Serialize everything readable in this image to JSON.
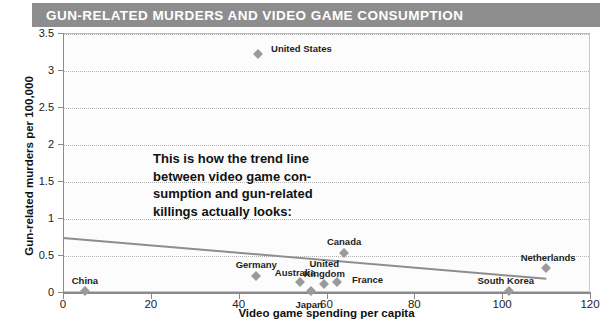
{
  "title": "GUN-RELATED MURDERS AND VIDEO GAME CONSUMPTION",
  "colors": {
    "title_bar": "#8d8d8d",
    "title_text": "#ffffff",
    "marker": "#9a9a9a",
    "trend_line": "#8d8d8d",
    "grid": "#b5b5b5",
    "plot_background": "#fcfcfc"
  },
  "annotation": {
    "lines": [
      "This is how the trend line",
      "between video game con-",
      "sumption and gun-related",
      "killings actually looks:"
    ]
  },
  "chart_data": {
    "type": "scatter",
    "title": "GUN-RELATED MURDERS AND VIDEO GAME CONSUMPTION",
    "xlabel": "Video game spending per capita",
    "ylabel": "Gun-related murders per 100,000",
    "xlim": [
      0,
      120
    ],
    "ylim": [
      0,
      3.5
    ],
    "xticks": [
      0,
      20,
      40,
      60,
      80,
      100,
      120
    ],
    "yticks": [
      0,
      0.5,
      1,
      1.5,
      2,
      2.5,
      3,
      3.5
    ],
    "xtick_labels": [
      "0",
      "20",
      "40",
      "60",
      "80",
      "100",
      "120"
    ],
    "ytick_labels": [
      "0",
      "0.5",
      "1",
      "1.5",
      "2",
      "2.5",
      "3",
      "3.5"
    ],
    "grid": true,
    "legend": false,
    "points": [
      {
        "label": "China",
        "x": 5,
        "y": 0.02,
        "label_dx": 0,
        "label_dy": -15,
        "label_align": "center"
      },
      {
        "label": "Germany",
        "x": 44,
        "y": 0.21,
        "label_dx": 0,
        "label_dy": -16,
        "label_align": "center"
      },
      {
        "label": "United States",
        "x": 44.5,
        "y": 3.22,
        "label_dx": 43,
        "label_dy": -10,
        "label_align": "center"
      },
      {
        "label": "Australia",
        "x": 54,
        "y": 0.13,
        "label_dx": -5,
        "label_dy": -14,
        "label_align": "center"
      },
      {
        "label": "Japan",
        "x": 56.5,
        "y": 0.02,
        "label_dx": -2,
        "label_dy": 9,
        "label_align": "center"
      },
      {
        "label": "United\nKingdom",
        "x": 59.5,
        "y": 0.11,
        "label_dx": 0,
        "label_dy": -25,
        "label_align": "center"
      },
      {
        "label": "France",
        "x": 62.5,
        "y": 0.13,
        "label_dx": 30,
        "label_dy": -7,
        "label_align": "center"
      },
      {
        "label": "Canada",
        "x": 64,
        "y": 0.53,
        "label_dx": 0,
        "label_dy": -16,
        "label_align": "center"
      },
      {
        "label": "South Korea",
        "x": 101.5,
        "y": 0.02,
        "label_dx": -3,
        "label_dy": -15,
        "label_align": "center"
      },
      {
        "label": "Netherlands",
        "x": 110,
        "y": 0.33,
        "label_dx": 2,
        "label_dy": -15,
        "label_align": "center"
      }
    ],
    "trend_line": {
      "x1": 0,
      "y1": 0.74,
      "x2": 110,
      "y2": 0.19
    }
  }
}
